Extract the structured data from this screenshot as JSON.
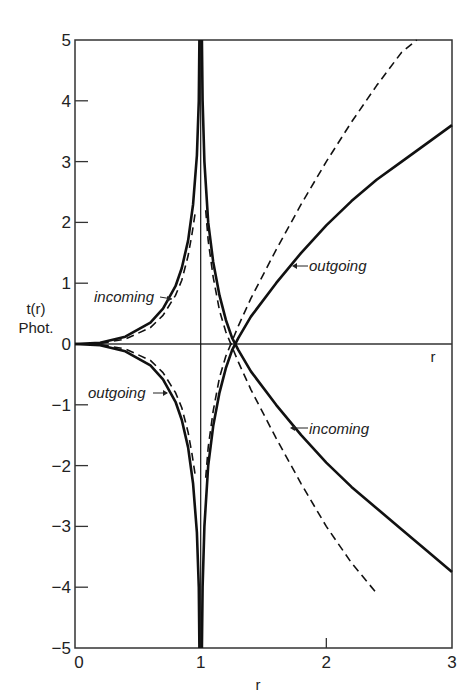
{
  "chart_data": {
    "type": "line",
    "title": "",
    "xlabel": "r",
    "ylabel": "t(r)\nPhot.",
    "ylabel_lines": [
      "t(r)",
      "Phot."
    ],
    "xlim": [
      0,
      3
    ],
    "ylim": [
      -5,
      5
    ],
    "xticks": [
      0,
      1,
      2,
      3
    ],
    "xtick_labels": [
      "0",
      "1",
      "2",
      "3"
    ],
    "yticks": [
      -5,
      -4,
      -3,
      -2,
      -1,
      0,
      1,
      2,
      3,
      4,
      5
    ],
    "ytick_labels": [
      "-5",
      "-4",
      "-3",
      "-2",
      "-1",
      "0",
      "1",
      "2",
      "3",
      "4",
      "5"
    ],
    "inner_axis_label": "r",
    "grid": false,
    "legend": "none",
    "series": [
      {
        "name": "incoming (solid, r<1 upper branch)",
        "style": "solid",
        "x": [
          0.0,
          0.2,
          0.4,
          0.6,
          0.7,
          0.8,
          0.85,
          0.9,
          0.94,
          0.97,
          0.985,
          0.99
        ],
        "y": [
          0.0,
          0.02,
          0.12,
          0.35,
          0.58,
          0.95,
          1.25,
          1.7,
          2.3,
          3.1,
          4.0,
          5.0
        ]
      },
      {
        "name": "outgoing (solid, r<1 lower branch)",
        "style": "solid",
        "x": [
          0.0,
          0.2,
          0.4,
          0.6,
          0.7,
          0.8,
          0.85,
          0.9,
          0.94,
          0.97,
          0.985,
          0.99
        ],
        "y": [
          0.0,
          -0.02,
          -0.12,
          -0.35,
          -0.58,
          -0.95,
          -1.25,
          -1.7,
          -2.3,
          -3.1,
          -4.0,
          -5.0
        ]
      },
      {
        "name": "incoming (dashed, r<1)",
        "style": "dashed",
        "x": [
          0.0,
          0.2,
          0.4,
          0.6,
          0.7,
          0.8,
          0.85,
          0.9,
          0.93,
          0.96
        ],
        "y": [
          0.0,
          0.01,
          0.08,
          0.27,
          0.47,
          0.8,
          1.05,
          1.45,
          1.8,
          2.2
        ]
      },
      {
        "name": "outgoing (dashed, r<1)",
        "style": "dashed",
        "x": [
          0.0,
          0.2,
          0.4,
          0.6,
          0.7,
          0.8,
          0.85,
          0.9,
          0.93,
          0.96
        ],
        "y": [
          0.0,
          -0.01,
          -0.08,
          -0.27,
          -0.47,
          -0.8,
          -1.05,
          -1.45,
          -1.8,
          -2.2
        ]
      },
      {
        "name": "outgoing (solid, r>1)",
        "style": "solid",
        "x": [
          1.01,
          1.015,
          1.03,
          1.06,
          1.1,
          1.15,
          1.2,
          1.25,
          1.3,
          1.4,
          1.6,
          1.8,
          2.0,
          2.2,
          2.4,
          2.6,
          2.8,
          3.0
        ],
        "y": [
          -5.0,
          -4.0,
          -3.0,
          -2.0,
          -1.35,
          -0.8,
          -0.4,
          -0.1,
          0.1,
          0.45,
          1.0,
          1.5,
          1.95,
          2.35,
          2.7,
          3.0,
          3.3,
          3.6
        ]
      },
      {
        "name": "incoming (solid, r>1)",
        "style": "solid",
        "x": [
          1.01,
          1.015,
          1.03,
          1.06,
          1.1,
          1.15,
          1.2,
          1.25,
          1.3,
          1.4,
          1.6,
          1.8,
          2.0,
          2.2,
          2.4,
          2.6,
          2.8,
          3.0
        ],
        "y": [
          5.0,
          4.0,
          3.0,
          2.0,
          1.35,
          0.8,
          0.4,
          0.1,
          -0.1,
          -0.45,
          -1.0,
          -1.5,
          -1.95,
          -2.35,
          -2.7,
          -3.05,
          -3.4,
          -3.75
        ]
      },
      {
        "name": "outgoing (dashed, r>1)",
        "style": "dashed",
        "x": [
          1.04,
          1.06,
          1.1,
          1.15,
          1.2,
          1.25,
          1.3,
          1.4,
          1.6,
          1.8,
          2.0,
          2.2,
          2.4,
          2.6,
          2.72
        ],
        "y": [
          -2.2,
          -1.7,
          -1.1,
          -0.55,
          -0.2,
          0.05,
          0.3,
          0.75,
          1.55,
          2.3,
          3.0,
          3.65,
          4.25,
          4.8,
          5.0
        ]
      },
      {
        "name": "incoming (dashed, r>1)",
        "style": "dashed",
        "x": [
          1.04,
          1.06,
          1.1,
          1.15,
          1.2,
          1.25,
          1.3,
          1.4,
          1.6,
          1.8,
          2.0,
          2.2,
          2.4
        ],
        "y": [
          2.2,
          1.7,
          1.1,
          0.55,
          0.2,
          -0.05,
          -0.3,
          -0.75,
          -1.55,
          -2.3,
          -3.0,
          -3.6,
          -4.1
        ]
      },
      {
        "name": "r = 1 vertical line",
        "style": "thin",
        "x": [
          1.0,
          1.0
        ],
        "y": [
          -5.0,
          5.0
        ]
      }
    ],
    "annotations": [
      {
        "text": "incoming",
        "arrow": "right",
        "at_x": 0.18,
        "at_y": 0.72
      },
      {
        "text": "outgoing",
        "arrow": "right",
        "at_x": 0.12,
        "at_y": -0.82
      },
      {
        "text": "outgoing",
        "arrow": "left",
        "at_x": 1.7,
        "at_y": 1.25
      },
      {
        "text": "incoming",
        "arrow": "left",
        "at_x": 1.72,
        "at_y": -1.4
      }
    ]
  },
  "labels": {
    "ylabel_line1": "t(r)",
    "ylabel_line2": "Phot.",
    "xlabel": "r",
    "inner_r": "r",
    "annot_incoming_left": "incoming",
    "annot_outgoing_left": "outgoing",
    "annot_outgoing_right": "outgoing",
    "annot_incoming_right": "incoming"
  }
}
